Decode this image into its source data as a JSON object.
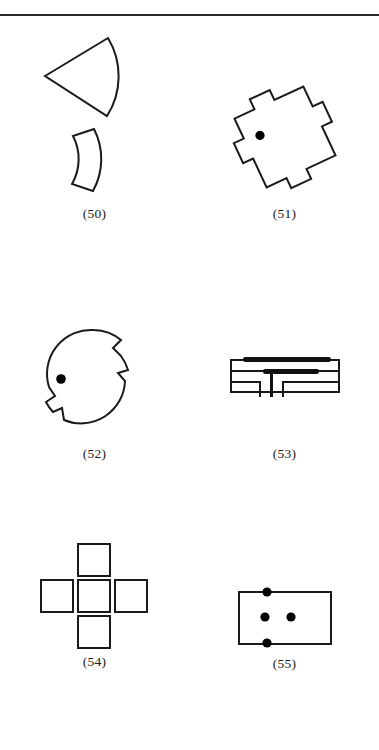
{
  "page": {
    "background_color": "#ffffff",
    "ink_color": "#1a1a1a",
    "top_rule": true,
    "width": 379,
    "height": 750
  },
  "figures": [
    {
      "caption": "(50)",
      "name": "figure-50",
      "description": "Circular sector (pie wedge) above an annular arc band (crescent)",
      "parts": [
        "sector-wedge",
        "arc-band"
      ]
    },
    {
      "caption": "(51)",
      "name": "figure-51",
      "description": "Rotated square with rectangular tabs and notches on each side, containing one filled dot near the upper-left interior",
      "parts": [
        "notched-square",
        "center-dot"
      ],
      "dot_count": 1
    },
    {
      "caption": "(52)",
      "name": "figure-52",
      "description": "Circle with stepped notches cut into the upper-right and lower-left arcs, containing one filled dot at mid-left interior",
      "parts": [
        "notched-circle",
        "center-dot"
      ],
      "dot_count": 1
    },
    {
      "caption": "(53)",
      "name": "figure-53",
      "description": "Rectangular outline containing two thick horizontal bars and a T-shaped feed stub extending downward between two lower arms",
      "parts": [
        "outer-rectangle",
        "upper-thick-bar",
        "lower-thick-bar",
        "feed-stub",
        "lower-arms"
      ]
    },
    {
      "caption": "(54)",
      "name": "figure-54",
      "description": "Plus/cross arrangement of five equal open squares",
      "parts": [
        "square-top",
        "square-left",
        "square-center",
        "square-right",
        "square-bottom"
      ],
      "square_count": 5
    },
    {
      "caption": "(55)",
      "name": "figure-55",
      "description": "Rectangle with four filled dots: one on the top edge, one on the bottom edge, and two in the interior middle row",
      "parts": [
        "rectangle",
        "dot-top-edge",
        "dot-bottom-edge",
        "dot-interior-left",
        "dot-interior-right"
      ],
      "dot_count": 4
    }
  ]
}
